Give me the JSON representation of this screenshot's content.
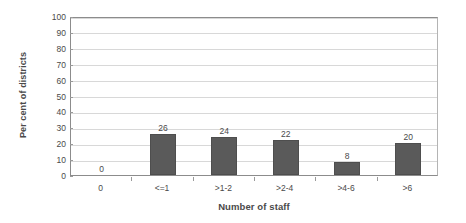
{
  "chart_data": {
    "type": "bar",
    "title": "",
    "subtitle": "",
    "xlabel": "Number of staff",
    "ylabel": "Per cent of districts",
    "categories": [
      "0",
      "<=1",
      ">1-2",
      ">2-4",
      ">4-6",
      ">6"
    ],
    "values": [
      0,
      26,
      24,
      22,
      8,
      20
    ],
    "data_labels": [
      "0",
      "26",
      "24",
      "22",
      "8",
      "20"
    ],
    "ylim": [
      0,
      100
    ],
    "ytick_step": 10,
    "ytick_labels": [
      "100",
      "90",
      "80",
      "70",
      "60",
      "50",
      "40",
      "30",
      "20",
      "10",
      "0"
    ],
    "ytick_values": [
      100,
      90,
      80,
      70,
      60,
      50,
      40,
      30,
      20,
      10,
      0
    ],
    "grid": true,
    "grid_axis": "y",
    "legend": false,
    "legend_position": "none",
    "series": [
      {
        "name": "Per cent of districts",
        "values": [
          0,
          26,
          24,
          22,
          8,
          20
        ]
      }
    ],
    "colors": {
      "bar_fill": "#5a5a5a",
      "bar_stroke": "#4e4e4e",
      "gridline": "#d8d8d8",
      "axis": "#8c8c8c",
      "text": "#4a4a4a",
      "background": "#ffffff"
    }
  }
}
